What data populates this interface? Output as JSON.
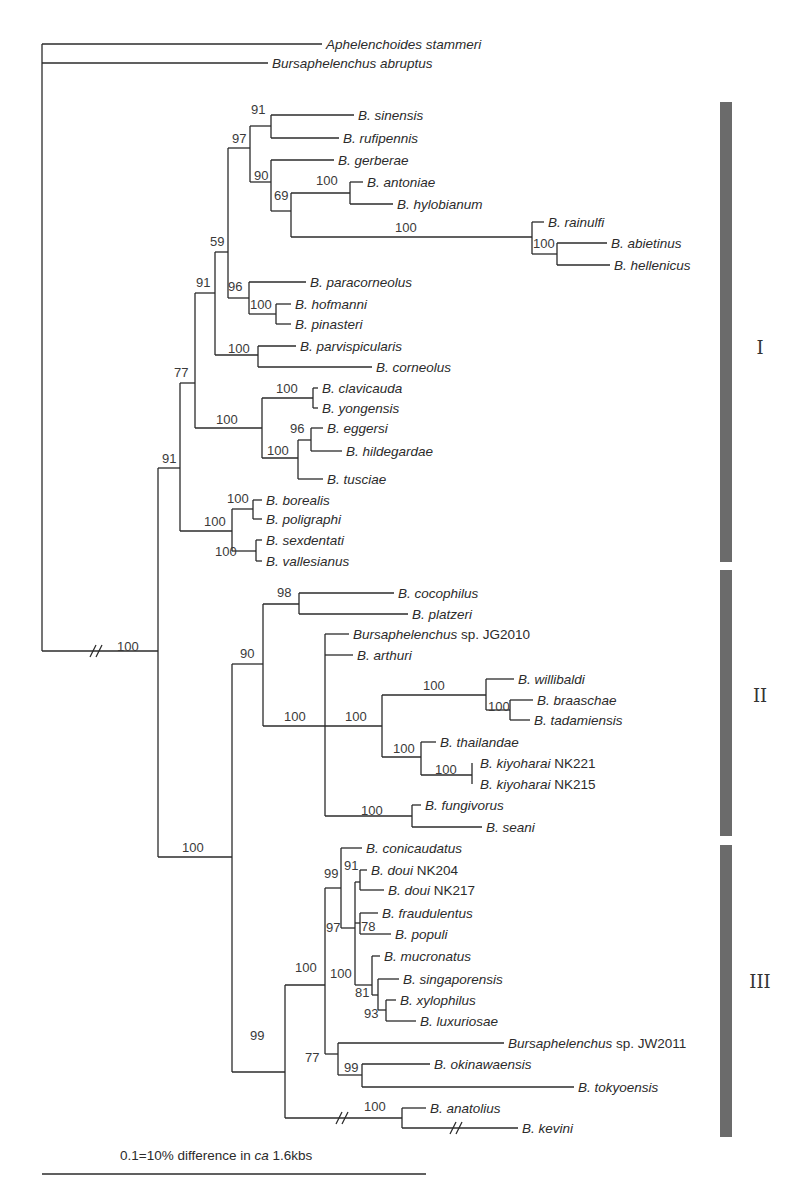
{
  "figure": {
    "type": "phylogenetic-tree",
    "scale_bar": {
      "label_pre": "0.1=10% difference in ",
      "label_ital": "ca",
      "label_post": " 1.6kbs",
      "x1": 42,
      "x2": 426,
      "y": 1174
    }
  },
  "leaves": [
    {
      "id": "L0",
      "genus": "Aphelenchoides stammeri",
      "suffix": "",
      "x": 326,
      "y": 44,
      "bx": 42
    },
    {
      "id": "L1",
      "genus": "Bursaphelenchus abruptus",
      "suffix": "",
      "x": 272,
      "y": 63,
      "bx": 42
    },
    {
      "id": "L2",
      "genus": "B. sinensis",
      "suffix": "",
      "x": 358,
      "y": 115
    },
    {
      "id": "L3",
      "genus": "B. rufipennis",
      "suffix": "",
      "x": 343,
      "y": 138
    },
    {
      "id": "L4",
      "genus": "B. gerberae",
      "suffix": "",
      "x": 338,
      "y": 160
    },
    {
      "id": "L5",
      "genus": "B. antoniae",
      "suffix": "",
      "x": 367,
      "y": 182
    },
    {
      "id": "L6",
      "genus": "B. hylobianum",
      "suffix": "",
      "x": 397,
      "y": 204
    },
    {
      "id": "L7",
      "genus": "B. rainulfi",
      "suffix": "",
      "x": 548,
      "y": 222
    },
    {
      "id": "L8",
      "genus": "B. abietinus",
      "suffix": "",
      "x": 611,
      "y": 243
    },
    {
      "id": "L9",
      "genus": "B. hellenicus",
      "suffix": "",
      "x": 614,
      "y": 265
    },
    {
      "id": "L10",
      "genus": "B. paracorneolus",
      "suffix": "",
      "x": 310,
      "y": 282
    },
    {
      "id": "L11",
      "genus": "B. hofmanni",
      "suffix": "",
      "x": 295,
      "y": 304
    },
    {
      "id": "L12",
      "genus": "B. pinasteri",
      "suffix": "",
      "x": 295,
      "y": 324
    },
    {
      "id": "L13",
      "genus": "B. parvispicularis",
      "suffix": "",
      "x": 300,
      "y": 346
    },
    {
      "id": "L14",
      "genus": "B. corneolus",
      "suffix": "",
      "x": 376,
      "y": 367
    },
    {
      "id": "L15",
      "genus": "B. clavicauda",
      "suffix": "",
      "x": 322,
      "y": 388
    },
    {
      "id": "L16",
      "genus": "B. yongensis",
      "suffix": "",
      "x": 322,
      "y": 408
    },
    {
      "id": "L17",
      "genus": "B. eggersi",
      "suffix": "",
      "x": 327,
      "y": 428
    },
    {
      "id": "L18",
      "genus": "B. hildegardae",
      "suffix": "",
      "x": 346,
      "y": 451
    },
    {
      "id": "L19",
      "genus": "B. tusciae",
      "suffix": "",
      "x": 327,
      "y": 479
    },
    {
      "id": "L20",
      "genus": "B. borealis",
      "suffix": "",
      "x": 266,
      "y": 500
    },
    {
      "id": "L21",
      "genus": "B. poligraphi",
      "suffix": "",
      "x": 266,
      "y": 519
    },
    {
      "id": "L22",
      "genus": "B. sexdentati",
      "suffix": "",
      "x": 266,
      "y": 540
    },
    {
      "id": "L23",
      "genus": "B. vallesianus",
      "suffix": "",
      "x": 266,
      "y": 561
    },
    {
      "id": "L24",
      "genus": "B. cocophilus",
      "suffix": "",
      "x": 398,
      "y": 593
    },
    {
      "id": "L25",
      "genus": "B. platzeri",
      "suffix": "",
      "x": 412,
      "y": 614
    },
    {
      "id": "L26",
      "genus": "Bursaphelenchus",
      "suffix": " sp. JG2010",
      "x": 353,
      "y": 634
    },
    {
      "id": "L27",
      "genus": "B. arthuri",
      "suffix": "",
      "x": 357,
      "y": 655
    },
    {
      "id": "L28",
      "genus": "B. willibaldi",
      "suffix": "",
      "x": 518,
      "y": 679
    },
    {
      "id": "L29",
      "genus": "B. braaschae",
      "suffix": "",
      "x": 537,
      "y": 700
    },
    {
      "id": "L30",
      "genus": "B. tadamiensis",
      "suffix": "",
      "x": 534,
      "y": 720
    },
    {
      "id": "L31",
      "genus": "B. thailandae",
      "suffix": "",
      "x": 440,
      "y": 742
    },
    {
      "id": "L32",
      "genus": "B. kiyoharai",
      "suffix": " NK221",
      "x": 480,
      "y": 763
    },
    {
      "id": "L33",
      "genus": "B. kiyoharai",
      "suffix": " NK215",
      "x": 480,
      "y": 784
    },
    {
      "id": "L34",
      "genus": "B. fungivorus",
      "suffix": "",
      "x": 425,
      "y": 805
    },
    {
      "id": "L35",
      "genus": "B. seani",
      "suffix": "",
      "x": 486,
      "y": 827
    },
    {
      "id": "L36",
      "genus": "B. conicaudatus",
      "suffix": "",
      "x": 366,
      "y": 848
    },
    {
      "id": "L37",
      "genus": "B. doui",
      "suffix": " NK204",
      "x": 371,
      "y": 870
    },
    {
      "id": "L38",
      "genus": "B. doui",
      "suffix": " NK217",
      "x": 388,
      "y": 890
    },
    {
      "id": "L39",
      "genus": "B. fraudulentus",
      "suffix": "",
      "x": 382,
      "y": 913
    },
    {
      "id": "L40",
      "genus": "B. populi",
      "suffix": "",
      "x": 395,
      "y": 934
    },
    {
      "id": "L41",
      "genus": "B. mucronatus",
      "suffix": "",
      "x": 384,
      "y": 956
    },
    {
      "id": "L42",
      "genus": "B. singaporensis",
      "suffix": "",
      "x": 403,
      "y": 979
    },
    {
      "id": "L43",
      "genus": "B. xylophilus",
      "suffix": "",
      "x": 400,
      "y": 1000
    },
    {
      "id": "L44",
      "genus": "B. luxuriosae",
      "suffix": "",
      "x": 420,
      "y": 1021
    },
    {
      "id": "L45",
      "genus": "Bursaphelenchus",
      "suffix": " sp. JW2011",
      "x": 508,
      "y": 1043
    },
    {
      "id": "L46",
      "genus": "B. okinawaensis",
      "suffix": "",
      "x": 434,
      "y": 1064
    },
    {
      "id": "L47",
      "genus": "B. tokyoensis",
      "suffix": "",
      "x": 578,
      "y": 1087
    },
    {
      "id": "L48",
      "genus": "B. anatolius",
      "suffix": "",
      "x": 430,
      "y": 1108
    },
    {
      "id": "L49",
      "genus": "B. kevini",
      "suffix": "",
      "x": 522,
      "y": 1128
    }
  ],
  "bootstrap": [
    {
      "v": "100",
      "x": 117,
      "y": 651
    },
    {
      "v": "91",
      "x": 162,
      "y": 463
    },
    {
      "v": "77",
      "x": 174,
      "y": 377
    },
    {
      "v": "91",
      "x": 196,
      "y": 287
    },
    {
      "v": "59",
      "x": 210,
      "y": 246
    },
    {
      "v": "97",
      "x": 232,
      "y": 143
    },
    {
      "v": "91",
      "x": 251,
      "y": 114
    },
    {
      "v": "90",
      "x": 254,
      "y": 180
    },
    {
      "v": "69",
      "x": 274,
      "y": 200
    },
    {
      "v": "100",
      "x": 316,
      "y": 185
    },
    {
      "v": "100",
      "x": 395,
      "y": 232
    },
    {
      "v": "100",
      "x": 533,
      "y": 248
    },
    {
      "v": "96",
      "x": 228,
      "y": 291
    },
    {
      "v": "100",
      "x": 250,
      "y": 309
    },
    {
      "v": "100",
      "x": 228,
      "y": 353
    },
    {
      "v": "100",
      "x": 276,
      "y": 393
    },
    {
      "v": "100",
      "x": 216,
      "y": 424
    },
    {
      "v": "96",
      "x": 290,
      "y": 433
    },
    {
      "v": "100",
      "x": 267,
      "y": 455
    },
    {
      "v": "100",
      "x": 227,
      "y": 503
    },
    {
      "v": "100",
      "x": 204,
      "y": 526
    },
    {
      "v": "100",
      "x": 215,
      "y": 556
    },
    {
      "v": "98",
      "x": 277,
      "y": 597
    },
    {
      "v": "90",
      "x": 240,
      "y": 658
    },
    {
      "v": "100",
      "x": 284,
      "y": 721
    },
    {
      "v": "100",
      "x": 345,
      "y": 721
    },
    {
      "v": "100",
      "x": 423,
      "y": 690
    },
    {
      "v": "100",
      "x": 488,
      "y": 711
    },
    {
      "v": "100",
      "x": 393,
      "y": 753
    },
    {
      "v": "100",
      "x": 435,
      "y": 774
    },
    {
      "v": "100",
      "x": 361,
      "y": 815
    },
    {
      "v": "100",
      "x": 182,
      "y": 852
    },
    {
      "v": "99",
      "x": 324,
      "y": 878
    },
    {
      "v": "91",
      "x": 344,
      "y": 870
    },
    {
      "v": "97",
      "x": 326,
      "y": 932
    },
    {
      "v": "78",
      "x": 361,
      "y": 931
    },
    {
      "v": "100",
      "x": 295,
      "y": 972
    },
    {
      "v": "100",
      "x": 330,
      "y": 978
    },
    {
      "v": "81",
      "x": 355,
      "y": 997
    },
    {
      "v": "93",
      "x": 364,
      "y": 1018
    },
    {
      "v": "99",
      "x": 250,
      "y": 1040
    },
    {
      "v": "77",
      "x": 305,
      "y": 1062
    },
    {
      "v": "99",
      "x": 344,
      "y": 1072
    },
    {
      "v": "100",
      "x": 364,
      "y": 1111
    }
  ],
  "clades": [
    {
      "label": "I",
      "y1": 102,
      "y2": 562,
      "ly": 354
    },
    {
      "label": "II",
      "y1": 570,
      "y2": 836,
      "ly": 702
    },
    {
      "label": "III",
      "y1": 845,
      "y2": 1137,
      "ly": 988
    }
  ],
  "colors": {
    "branch": "#2b2b2b",
    "clade_bar": "#6b6b6b"
  }
}
